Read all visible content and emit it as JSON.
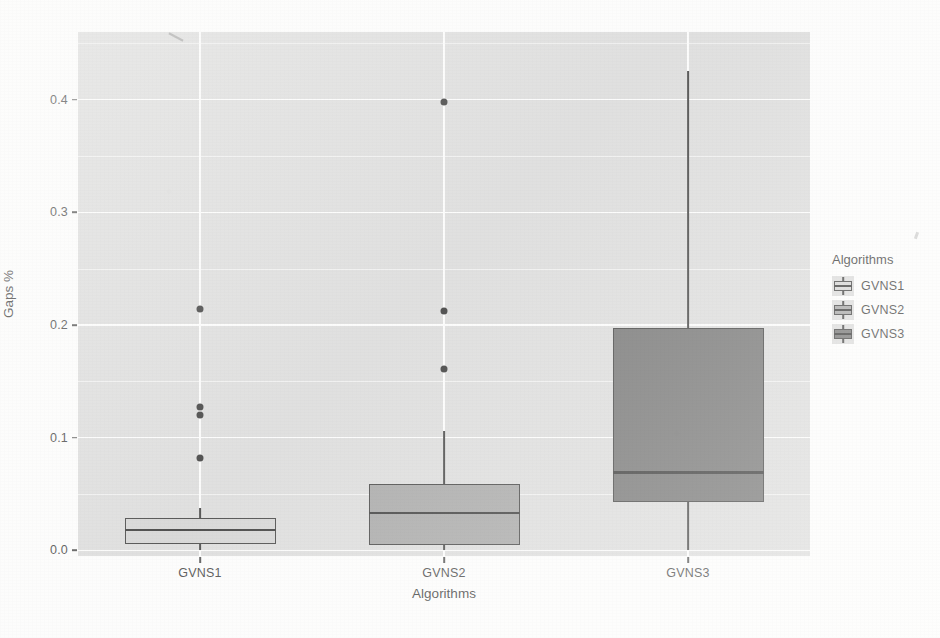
{
  "chart_data": {
    "type": "box",
    "title": "",
    "xlabel": "Algorithms",
    "ylabel": "Gaps %",
    "categories": [
      "GVNS1",
      "GVNS2",
      "GVNS3"
    ],
    "ylim": [
      -0.005,
      0.46
    ],
    "ytick_labels": [
      "0.0",
      "0.1",
      "0.2",
      "0.3",
      "0.4"
    ],
    "ytick_values": [
      0.0,
      0.1,
      0.2,
      0.3,
      0.4
    ],
    "grid": "horizontal-and-vertical major white gridlines on grey panel",
    "legend": {
      "title": "Algorithms",
      "position": "right",
      "entries": [
        "GVNS1",
        "GVNS2",
        "GVNS3"
      ]
    },
    "series": [
      {
        "name": "GVNS1",
        "fill": "#d0d0d0",
        "lower_whisker": 0.0,
        "q1": 0.006,
        "median": 0.018,
        "q3": 0.029,
        "upper_whisker": 0.038,
        "outliers": [
          0.214,
          0.127,
          0.12,
          0.082
        ]
      },
      {
        "name": "GVNS2",
        "fill": "#9a9a9a",
        "lower_whisker": 0.0,
        "q1": 0.005,
        "median": 0.033,
        "q3": 0.059,
        "upper_whisker": 0.106,
        "outliers": [
          0.398,
          0.212,
          0.161
        ]
      },
      {
        "name": "GVNS3",
        "fill": "#606060",
        "lower_whisker": 0.0,
        "q1": 0.043,
        "median": 0.069,
        "q3": 0.197,
        "upper_whisker": 0.425,
        "outliers": []
      }
    ]
  },
  "axes": {
    "y_title": "Gaps %",
    "x_title": "Algorithms",
    "y_ticks": [
      {
        "label": "0.0"
      },
      {
        "label": "0.1"
      },
      {
        "label": "0.2"
      },
      {
        "label": "0.3"
      },
      {
        "label": "0.4"
      }
    ],
    "x_ticks": [
      {
        "label": "GVNS1"
      },
      {
        "label": "GVNS2"
      },
      {
        "label": "GVNS3"
      }
    ]
  },
  "legend": {
    "title": "Algorithms",
    "items": [
      {
        "label": "GVNS1"
      },
      {
        "label": "GVNS2"
      },
      {
        "label": "GVNS3"
      }
    ]
  },
  "colors": {
    "panel": "#d9d9d9",
    "grid": "#ffffff",
    "ink": "#1a1a1a",
    "gvns1": "#d0d0d0",
    "gvns2": "#9a9a9a",
    "gvns3": "#606060"
  }
}
